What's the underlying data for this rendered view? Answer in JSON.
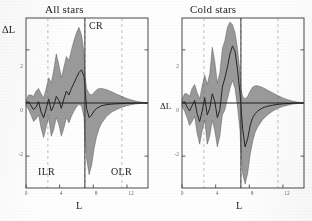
{
  "figure": {
    "ylabel": "ΔL",
    "xlabel": "L",
    "panels": [
      {
        "id": "all-stars",
        "title": "All stars",
        "resonances": [
          {
            "name": "ILR",
            "label": "ILR"
          },
          {
            "name": "CR",
            "label": "CR"
          },
          {
            "name": "OLR",
            "label": "OLR"
          }
        ]
      },
      {
        "id": "cold-stars",
        "title": "Cold stars",
        "resonances": []
      }
    ]
  },
  "chart_data": [
    {
      "type": "area",
      "id": "all-stars",
      "title": "All stars",
      "xlabel": "L",
      "ylabel": "ΔL",
      "xlim": [
        0,
        14.5
      ],
      "ylim": [
        -3.2,
        3.2
      ],
      "xticks": [
        0,
        4,
        8,
        12
      ],
      "xticklabels": [
        "0",
        "4",
        "8",
        "12"
      ],
      "yticks": [
        2,
        0,
        -2
      ],
      "yticklabels": [
        "2",
        "0",
        "-2"
      ],
      "grid": "vertical-dashed",
      "gridlines_x": [
        2.6,
        7.0,
        11.4
      ],
      "annotations": [
        {
          "text": "CR",
          "x": 7.0,
          "y": 2.55,
          "align": "left"
        },
        {
          "text": "ILR",
          "x": 2.6,
          "y": -2.35,
          "align": "center"
        },
        {
          "text": "OLR",
          "x": 11.2,
          "y": -2.35,
          "align": "center"
        }
      ],
      "resonance_lines": [
        {
          "name": "CR",
          "x": 7.0,
          "style": "solid"
        }
      ],
      "x": [
        0.0,
        0.3,
        0.6,
        0.9,
        1.2,
        1.5,
        1.8,
        2.1,
        2.4,
        2.7,
        3.0,
        3.3,
        3.6,
        3.9,
        4.2,
        4.5,
        4.8,
        5.1,
        5.4,
        5.7,
        6.0,
        6.3,
        6.6,
        6.9,
        7.0,
        7.2,
        7.5,
        7.8,
        8.1,
        8.4,
        8.7,
        9.0,
        9.6,
        10.2,
        10.8,
        11.4,
        12.0,
        12.6,
        13.2,
        13.8,
        14.4
      ],
      "series": [
        {
          "name": "mean",
          "values": [
            0.0,
            0.05,
            -0.1,
            -0.25,
            -0.15,
            0.05,
            -0.35,
            -0.55,
            -0.2,
            0.15,
            -0.3,
            -0.1,
            0.25,
            0.1,
            -0.2,
            0.15,
            0.45,
            0.3,
            0.55,
            0.75,
            0.95,
            1.15,
            1.25,
            1.0,
            0.6,
            -0.2,
            -0.55,
            -0.45,
            -0.3,
            -0.2,
            -0.15,
            -0.1,
            -0.06,
            -0.04,
            -0.03,
            -0.02,
            -0.01,
            -0.01,
            0.0,
            0.0,
            0.0
          ]
        },
        {
          "name": "upper_band",
          "values": [
            0.1,
            0.3,
            0.3,
            0.25,
            0.45,
            0.55,
            0.35,
            0.2,
            0.55,
            0.95,
            0.75,
            1.25,
            1.85,
            1.45,
            0.95,
            1.35,
            1.75,
            1.6,
            2.0,
            2.35,
            2.65,
            2.85,
            2.55,
            1.9,
            1.1,
            0.55,
            0.35,
            0.3,
            0.4,
            0.5,
            0.55,
            0.55,
            0.5,
            0.42,
            0.33,
            0.25,
            0.17,
            0.11,
            0.06,
            0.03,
            0.01
          ]
        },
        {
          "name": "lower_band",
          "values": [
            -0.1,
            -0.25,
            -0.45,
            -0.7,
            -0.6,
            -0.45,
            -0.95,
            -1.3,
            -0.9,
            -0.55,
            -1.25,
            -1.0,
            -0.55,
            -0.8,
            -1.25,
            -0.95,
            -0.55,
            -0.75,
            -0.5,
            -0.3,
            -0.15,
            -0.05,
            -0.1,
            -0.55,
            -1.35,
            -2.1,
            -2.7,
            -2.35,
            -1.7,
            -1.25,
            -0.95,
            -0.75,
            -0.5,
            -0.34,
            -0.24,
            -0.16,
            -0.1,
            -0.06,
            -0.03,
            -0.01,
            0.0
          ]
        }
      ]
    },
    {
      "type": "area",
      "id": "cold-stars",
      "title": "Cold stars",
      "xlabel": "L",
      "ylabel": "ΔL",
      "xlim": [
        0,
        14.5
      ],
      "ylim": [
        -3.2,
        3.2
      ],
      "xticks": [
        0,
        4,
        8,
        12
      ],
      "xticklabels": [
        "0",
        "4",
        "8",
        "12"
      ],
      "yticks": [
        2,
        0,
        -2
      ],
      "yticklabels": [
        "2",
        "0",
        "-2"
      ],
      "grid": "vertical-dashed",
      "gridlines_x": [
        2.6,
        7.0,
        11.4
      ],
      "annotations": [],
      "resonance_lines": [
        {
          "name": "CR",
          "x": 7.0,
          "style": "solid"
        }
      ],
      "x": [
        0.0,
        0.3,
        0.6,
        0.9,
        1.2,
        1.5,
        1.8,
        2.1,
        2.4,
        2.7,
        3.0,
        3.3,
        3.6,
        3.9,
        4.2,
        4.5,
        4.8,
        5.1,
        5.4,
        5.7,
        6.0,
        6.3,
        6.6,
        6.9,
        7.0,
        7.2,
        7.5,
        7.8,
        8.1,
        8.4,
        8.7,
        9.0,
        9.6,
        10.2,
        10.8,
        11.4,
        12.0,
        12.6,
        13.2,
        13.8,
        14.4
      ],
      "series": [
        {
          "name": "mean",
          "values": [
            0.0,
            0.05,
            -0.15,
            -0.3,
            -0.1,
            0.1,
            -0.4,
            -0.7,
            -0.3,
            0.2,
            -0.45,
            -0.2,
            0.35,
            0.05,
            -0.55,
            -0.25,
            0.6,
            0.95,
            1.35,
            1.85,
            2.15,
            1.95,
            1.25,
            0.35,
            -0.1,
            -0.95,
            -1.65,
            -1.35,
            -0.85,
            -0.55,
            -0.4,
            -0.3,
            -0.18,
            -0.12,
            -0.08,
            -0.05,
            -0.03,
            -0.02,
            -0.01,
            0.0,
            0.0
          ]
        },
        {
          "name": "upper_band",
          "values": [
            0.12,
            0.35,
            0.35,
            0.25,
            0.55,
            0.7,
            0.4,
            0.15,
            0.65,
            1.05,
            0.7,
            1.1,
            2.1,
            1.55,
            0.75,
            1.15,
            2.05,
            2.35,
            2.85,
            3.05,
            2.95,
            2.65,
            2.05,
            1.15,
            0.55,
            0.25,
            0.15,
            0.25,
            0.45,
            0.6,
            0.65,
            0.65,
            0.58,
            0.48,
            0.38,
            0.28,
            0.19,
            0.12,
            0.07,
            0.03,
            0.01
          ]
        },
        {
          "name": "lower_band",
          "values": [
            -0.12,
            -0.3,
            -0.55,
            -0.85,
            -0.7,
            -0.5,
            -1.15,
            -1.55,
            -1.05,
            -0.65,
            -1.55,
            -1.25,
            -0.65,
            -1.05,
            -1.65,
            -1.25,
            -0.45,
            -0.25,
            0.15,
            0.55,
            0.85,
            0.55,
            -0.15,
            -1.05,
            -1.75,
            -2.65,
            -3.05,
            -2.65,
            -1.95,
            -1.45,
            -1.1,
            -0.9,
            -0.62,
            -0.44,
            -0.3,
            -0.2,
            -0.13,
            -0.08,
            -0.04,
            -0.02,
            0.0
          ]
        }
      ]
    }
  ]
}
